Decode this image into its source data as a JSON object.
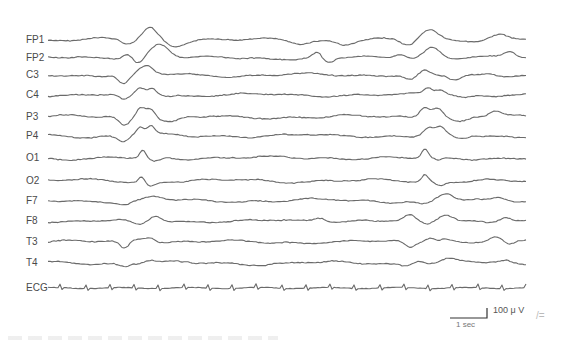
{
  "figure": {
    "type": "EEG recording",
    "channels": [
      {
        "label": "FP1",
        "y": 40
      },
      {
        "label": "FP2",
        "y": 58
      },
      {
        "label": "C3",
        "y": 75
      },
      {
        "label": "C4",
        "y": 95
      },
      {
        "label": "P3",
        "y": 117
      },
      {
        "label": "P4",
        "y": 136
      },
      {
        "label": "O1",
        "y": 158
      },
      {
        "label": "O2",
        "y": 181
      },
      {
        "label": "F7",
        "y": 201
      },
      {
        "label": "F8",
        "y": 221
      },
      {
        "label": "T3",
        "y": 242
      },
      {
        "label": "T4",
        "y": 263
      },
      {
        "label": "ECG",
        "y": 288
      }
    ],
    "scale_bar": {
      "amplitude_label": "100 μ V",
      "time_label": "1 sec"
    },
    "corner_mark": "/="
  }
}
